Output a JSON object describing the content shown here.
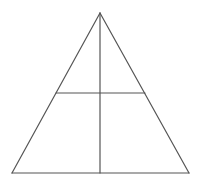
{
  "figure": {
    "name": "triangle-with-median-and-midsegment",
    "background_color": "#ffffff",
    "stroke_color": "#555555",
    "stroke_width": 1.2,
    "canvas": {
      "width": 200,
      "height": 182
    },
    "points": {
      "apex": {
        "x": 100,
        "y": 13
      },
      "base_left": {
        "x": 12,
        "y": 173
      },
      "base_right": {
        "x": 189,
        "y": 173
      },
      "base_midpoint": {
        "x": 100,
        "y": 173
      },
      "left_side_midpoint": {
        "x": 56,
        "y": 93
      },
      "right_side_midpoint": {
        "x": 145,
        "y": 93
      }
    },
    "segments": [
      {
        "name": "left-side",
        "from": "apex",
        "to": "base_left"
      },
      {
        "name": "right-side",
        "from": "apex",
        "to": "base_right"
      },
      {
        "name": "base",
        "from": "base_left",
        "to": "base_right"
      },
      {
        "name": "vertical-median",
        "from": "apex",
        "to": "base_midpoint"
      },
      {
        "name": "horizontal-midsegment",
        "from": "left_side_midpoint",
        "to": "right_side_midpoint"
      }
    ]
  }
}
